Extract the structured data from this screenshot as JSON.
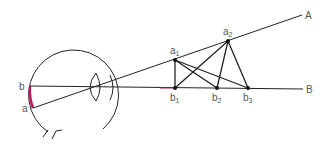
{
  "diagram": {
    "title": "",
    "labels": {
      "retina_b": "b",
      "retina_a": "a",
      "line_A": "A",
      "line_B": "B",
      "a1": "a",
      "a1_sub": "1",
      "a2": "a",
      "a2_sub": "2",
      "b1": "b",
      "b1_sub": "1",
      "b2": "b",
      "b2_sub": "2",
      "b3": "b",
      "b3_sub": "3"
    },
    "colors": {
      "line": "#222222",
      "retina_highlight": "#c2185b",
      "label": "#555555"
    },
    "points": {
      "a1": [
        175,
        60
      ],
      "a2": [
        228,
        41
      ],
      "b1": [
        175,
        88
      ],
      "b2": [
        217,
        88
      ],
      "b3": [
        248,
        88
      ]
    }
  }
}
